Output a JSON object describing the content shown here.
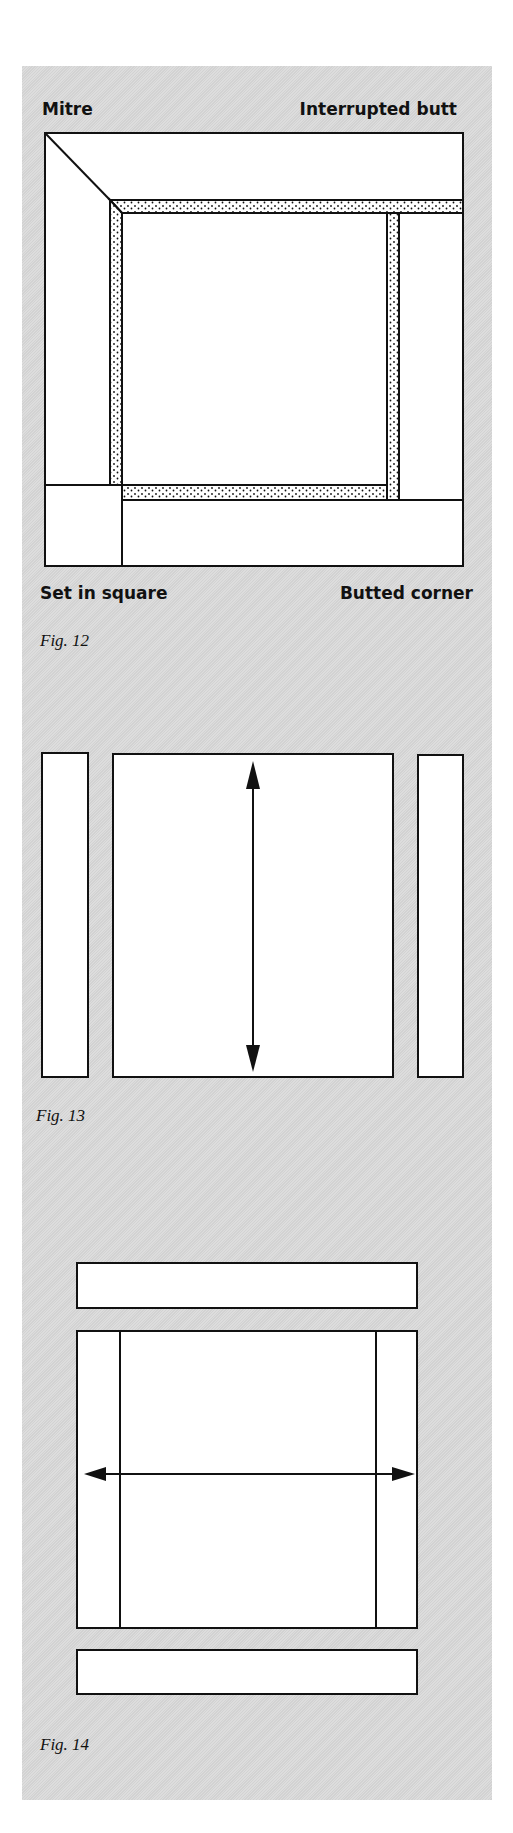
{
  "figures": [
    {
      "id": "fig12",
      "caption": "Fig. 12",
      "labels": {
        "top_left": "Mitre",
        "top_right": "Interrupted butt",
        "bottom_left": "Set in square",
        "bottom_right": "Butted corner"
      },
      "description": "Frame with four border joint types: mitre, interrupted butt, set-in square, butted corner; dotted inner border strips"
    },
    {
      "id": "fig13",
      "caption": "Fig. 13",
      "description": "Centre panel with vertical double-headed arrow, flanked by two narrow vertical side strips"
    },
    {
      "id": "fig14",
      "caption": "Fig. 14",
      "description": "Centre panel with side strips attached and horizontal double-headed arrow; separate top and bottom strips"
    }
  ],
  "colors": {
    "panel_bg": "#d9d9d9",
    "line": "#111111",
    "fill": "#ffffff"
  }
}
